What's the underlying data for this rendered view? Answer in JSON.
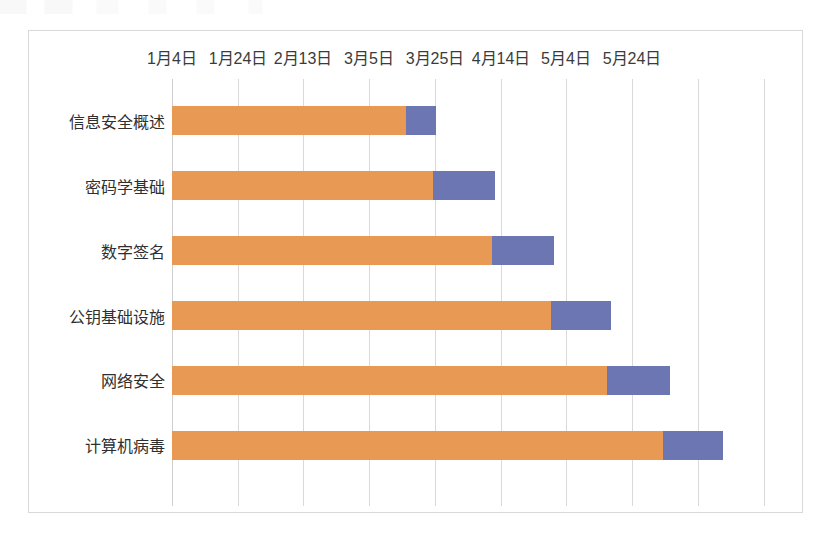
{
  "chart_data": {
    "type": "bar",
    "subtype": "gantt-stacked-bar",
    "title": "",
    "xlabel": "",
    "ylabel": "",
    "orientation": "horizontal",
    "grid": true,
    "legend_visible": false,
    "categories": [
      "信息安全概述",
      "密码学基础",
      "数字签名",
      "公钥基础设施",
      "网络安全",
      "计算机病毒"
    ],
    "x_tick_labels": [
      "1月4日",
      "1月24日",
      "2月13日",
      "3月5日",
      "3月25日",
      "4月14日",
      "5月4日",
      "5月24日"
    ],
    "x_tick_values_days": [
      0,
      20,
      40,
      60,
      80,
      100,
      120,
      140
    ],
    "xlim_days": [
      0,
      140
    ],
    "series": [
      {
        "name": "开始日期",
        "color": "#e89a55",
        "values": [
          71,
          79,
          97,
          115,
          132,
          149
        ]
      },
      {
        "name": "持续时间",
        "color": "#6c76b3",
        "values": [
          9,
          19,
          19,
          18,
          19,
          18
        ]
      }
    ],
    "bars": [
      {
        "category": "信息安全概述",
        "start_day": 0,
        "start_label": "1月4日",
        "offset_days": 71,
        "duration_days": 9,
        "end_day": 80,
        "end_label": "3月25日"
      },
      {
        "category": "密码学基础",
        "start_day": 0,
        "start_label": "1月4日",
        "offset_days": 79,
        "duration_days": 19,
        "end_day": 98,
        "end_label": "4月11日"
      },
      {
        "category": "数字签名",
        "start_day": 0,
        "start_label": "1月4日",
        "offset_days": 97,
        "duration_days": 19,
        "end_day": 116,
        "end_label": "4月29日"
      },
      {
        "category": "公钥基础设施",
        "start_day": 0,
        "start_label": "1月4日",
        "offset_days": 115,
        "duration_days": 18,
        "end_day": 133,
        "end_label": "5月16日"
      },
      {
        "category": "网络安全",
        "start_day": 0,
        "start_label": "1月4日",
        "offset_days": 132,
        "duration_days": 19,
        "end_day": 151,
        "end_label": "6月3日"
      },
      {
        "category": "计算机病毒",
        "start_day": 0,
        "start_label": "1月4日",
        "offset_days": 149,
        "duration_days": 18,
        "end_day": 167,
        "end_label": "6月19日"
      }
    ],
    "colors": {
      "series_start": "#e89a55",
      "series_duration": "#6c76b3",
      "gridline": "#d9d9d9",
      "border": "#d9d9d9",
      "axis_text": "#3b3b3b",
      "category_text": "#2f2f2f",
      "background": "#ffffff"
    }
  }
}
